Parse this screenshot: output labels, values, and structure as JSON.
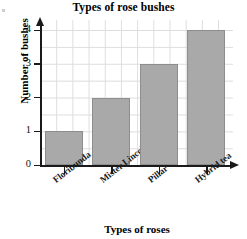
{
  "chart_data": {
    "type": "bar",
    "title": "Types of rose bushes",
    "xlabel": "Types of roses",
    "ylabel": "Number of bushes",
    "categories": [
      "Floribunda",
      "Mister Lincoln",
      "Pillar",
      "Hybrid tea"
    ],
    "values": [
      1,
      2,
      3,
      4
    ],
    "yticks": [
      "0",
      "1",
      "2",
      "3",
      "4"
    ],
    "ylim": [
      0,
      4.3
    ],
    "grid": true,
    "legend": "none",
    "colors": {
      "bar_fill": "#a9a9a9",
      "bar_edge": "#8d8d8d",
      "axis": "#1a1a1a",
      "grid": "#d8d8d8",
      "background": "#ffffff",
      "text": "#000000"
    }
  },
  "axes": {
    "y_arrow": "arrow-up-icon",
    "x_arrow": "arrow-right-icon"
  }
}
